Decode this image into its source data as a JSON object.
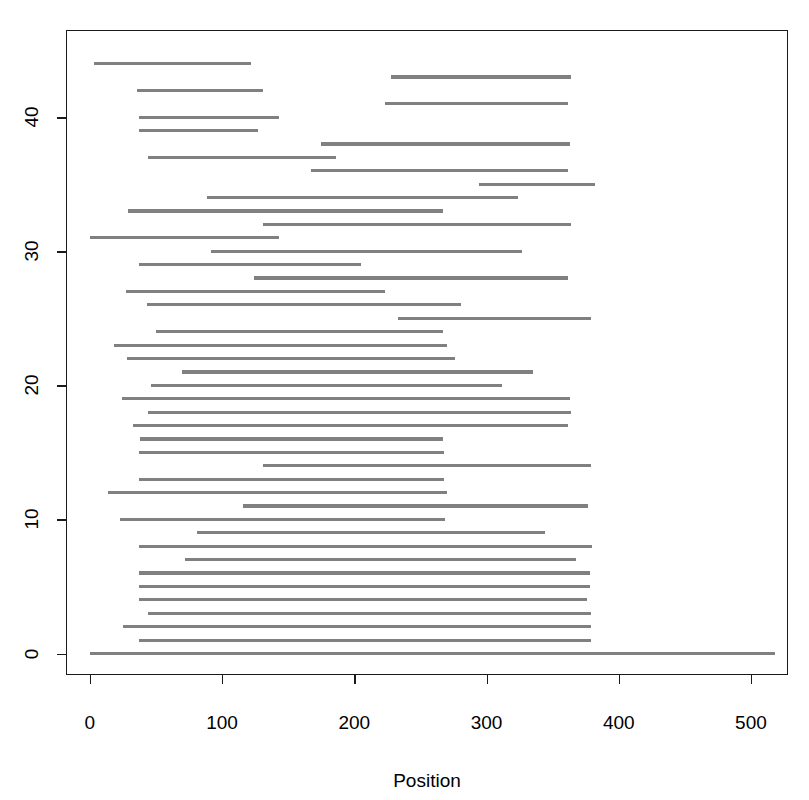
{
  "chart_data": {
    "type": "line",
    "title": "",
    "subtitle": "",
    "xlabel": "Position",
    "ylabel": "",
    "xlim": [
      -18,
      528
    ],
    "ylim": [
      -1.6,
      46.5
    ],
    "grid": false,
    "legend": null,
    "x_ticks": [
      0,
      100,
      200,
      300,
      400,
      500
    ],
    "x_tick_labels": [
      "0",
      "100",
      "200",
      "300",
      "400",
      "500"
    ],
    "y_ticks": [
      0,
      10,
      20,
      30,
      40
    ],
    "y_tick_labels": [
      "0",
      "10",
      "20",
      "30",
      "40"
    ],
    "series_color": "#808080",
    "frame_color": "#1a1a1a",
    "segments": [
      {
        "y": 44,
        "start": 3,
        "end": 122
      },
      {
        "y": 43,
        "start": 228,
        "end": 364
      },
      {
        "y": 42,
        "start": 36,
        "end": 131
      },
      {
        "y": 41,
        "start": 223,
        "end": 362
      },
      {
        "y": 40,
        "start": 37,
        "end": 143
      },
      {
        "y": 39,
        "start": 37,
        "end": 127
      },
      {
        "y": 38,
        "start": 175,
        "end": 363
      },
      {
        "y": 37,
        "start": 44,
        "end": 186
      },
      {
        "y": 36,
        "start": 167,
        "end": 362
      },
      {
        "y": 35,
        "start": 294,
        "end": 382
      },
      {
        "y": 34,
        "start": 89,
        "end": 324
      },
      {
        "y": 33,
        "start": 29,
        "end": 267
      },
      {
        "y": 32,
        "start": 131,
        "end": 364
      },
      {
        "y": 31,
        "start": 0,
        "end": 143
      },
      {
        "y": 30,
        "start": 92,
        "end": 327
      },
      {
        "y": 29,
        "start": 37,
        "end": 205
      },
      {
        "y": 28,
        "start": 124,
        "end": 362
      },
      {
        "y": 27,
        "start": 27,
        "end": 223
      },
      {
        "y": 26,
        "start": 43,
        "end": 281
      },
      {
        "y": 25,
        "start": 233,
        "end": 379
      },
      {
        "y": 24,
        "start": 50,
        "end": 267
      },
      {
        "y": 23,
        "start": 18,
        "end": 270
      },
      {
        "y": 22,
        "start": 28,
        "end": 276
      },
      {
        "y": 21,
        "start": 70,
        "end": 335
      },
      {
        "y": 20,
        "start": 46,
        "end": 312
      },
      {
        "y": 19,
        "start": 24,
        "end": 363
      },
      {
        "y": 18,
        "start": 44,
        "end": 364
      },
      {
        "y": 17,
        "start": 33,
        "end": 362
      },
      {
        "y": 16,
        "start": 38,
        "end": 267
      },
      {
        "y": 15,
        "start": 37,
        "end": 268
      },
      {
        "y": 14,
        "start": 131,
        "end": 379
      },
      {
        "y": 13,
        "start": 37,
        "end": 268
      },
      {
        "y": 12,
        "start": 14,
        "end": 270
      },
      {
        "y": 11,
        "start": 116,
        "end": 377
      },
      {
        "y": 10,
        "start": 23,
        "end": 269
      },
      {
        "y": 9,
        "start": 81,
        "end": 344
      },
      {
        "y": 8,
        "start": 37,
        "end": 380
      },
      {
        "y": 7,
        "start": 72,
        "end": 368
      },
      {
        "y": 6,
        "start": 37,
        "end": 378
      },
      {
        "y": 5,
        "start": 37,
        "end": 378
      },
      {
        "y": 4,
        "start": 37,
        "end": 376
      },
      {
        "y": 3,
        "start": 44,
        "end": 379
      },
      {
        "y": 2,
        "start": 25,
        "end": 379
      },
      {
        "y": 1,
        "start": 37,
        "end": 379
      },
      {
        "y": 0,
        "start": 0,
        "end": 518
      }
    ]
  },
  "layout": {
    "plot_left_px": 66,
    "plot_top_px": 30,
    "plot_width_px": 722,
    "plot_height_px": 645,
    "x_axis_label_y_px": 770,
    "x_tick_label_y_px": 712,
    "y_tick_label_x_px": 32
  }
}
